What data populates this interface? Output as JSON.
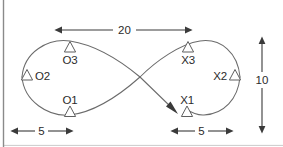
{
  "figure": {
    "shape_name": "figure-eight-path",
    "stroke_color": "#6b6b6b",
    "dimension_color": "#3a3a3a",
    "background_color": "#ffffff"
  },
  "markers": {
    "left_lobe": [
      {
        "id": "O3",
        "label": "O3",
        "marker": "triangle-marker",
        "marker_position": "above-label"
      },
      {
        "id": "O2",
        "label": "O2",
        "marker": "triangle-marker",
        "marker_position": "left-of-label"
      },
      {
        "id": "O1",
        "label": "O1",
        "marker": "triangle-marker",
        "marker_position": "below-label"
      }
    ],
    "right_lobe": [
      {
        "id": "X3",
        "label": "X3",
        "marker": "triangle-marker",
        "marker_position": "above-label"
      },
      {
        "id": "X2",
        "label": "X2",
        "marker": "triangle-marker",
        "marker_position": "right-of-label"
      },
      {
        "id": "X1",
        "label": "X1",
        "marker": "triangle-marker",
        "marker_position": "below-label"
      }
    ]
  },
  "dimensions": {
    "top_width": {
      "value": "20",
      "orientation": "horizontal",
      "arrows": "both-ends"
    },
    "right_height": {
      "value": "10",
      "orientation": "vertical",
      "arrows": "both-ends"
    },
    "bottom_left_offset": {
      "value": "5",
      "orientation": "horizontal",
      "arrows": "both-ends"
    },
    "bottom_right_offset": {
      "value": "5",
      "orientation": "horizontal",
      "arrows": "both-ends"
    }
  },
  "annotations": {
    "direction_arrow": {
      "name": "path-direction-arrow",
      "points_to": "X1"
    }
  }
}
